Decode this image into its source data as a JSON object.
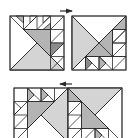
{
  "diagram": {
    "type": "quilt-block-assembly",
    "colors": {
      "background": "#ffffff",
      "line": "#2a2a2a",
      "light_fill": "#d4d4d4",
      "mid_fill": "#b4b4b4",
      "dark_fill": "#8c8c8c"
    },
    "arrows": [
      {
        "direction": "right",
        "row": "top"
      },
      {
        "direction": "left",
        "row": "bottom"
      }
    ],
    "rows": [
      {
        "name": "top-row",
        "blocks": [
          "block-a",
          "block-b"
        ],
        "joined": false
      },
      {
        "name": "bottom-row",
        "blocks": [
          "block-c",
          "block-d"
        ],
        "joined": true
      }
    ]
  }
}
